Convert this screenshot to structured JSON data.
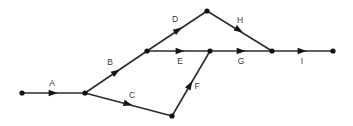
{
  "diagram": {
    "type": "directed-graph",
    "width": 353,
    "height": 126,
    "background_color": "#ffffff",
    "line_color": "#2b2b2b",
    "node_color": "#111111",
    "label_color": "#3a3a3a",
    "nodes": [
      {
        "id": "n1",
        "name": "node-start",
        "x": 22,
        "y": 93
      },
      {
        "id": "n2",
        "name": "node-junction-1",
        "x": 85,
        "y": 93
      },
      {
        "id": "n3",
        "name": "node-junction-2",
        "x": 147,
        "y": 51
      },
      {
        "id": "n4",
        "name": "node-apex",
        "x": 207,
        "y": 11
      },
      {
        "id": "n5",
        "name": "node-middle",
        "x": 210,
        "y": 51
      },
      {
        "id": "n6",
        "name": "node-bottom",
        "x": 172,
        "y": 116
      },
      {
        "id": "n7",
        "name": "node-merge",
        "x": 272,
        "y": 51
      },
      {
        "id": "n8",
        "name": "node-end",
        "x": 333,
        "y": 51
      }
    ],
    "edges": [
      {
        "id": "e-a",
        "label": "A",
        "from": "n1",
        "to": "n2",
        "arrow": {
          "x": 53,
          "y": 93
        },
        "label_pos": {
          "x": 52,
          "y": 84
        }
      },
      {
        "id": "e-b",
        "label": "B",
        "from": "n2",
        "to": "n3",
        "arrow": {
          "x": 116,
          "y": 72
        },
        "label_pos": {
          "x": 110,
          "y": 63
        }
      },
      {
        "id": "e-c",
        "label": "C",
        "from": "n2",
        "to": "n6",
        "arrow": {
          "x": 128,
          "y": 104
        },
        "label_pos": {
          "x": 132,
          "y": 96
        }
      },
      {
        "id": "e-d",
        "label": "D",
        "from": "n3",
        "to": "n4",
        "arrow": {
          "x": 178,
          "y": 30
        },
        "label_pos": {
          "x": 175,
          "y": 20
        }
      },
      {
        "id": "e-e",
        "label": "E",
        "from": "n3",
        "to": "n5",
        "arrow": {
          "x": 180,
          "y": 51
        },
        "label_pos": {
          "x": 180,
          "y": 62
        }
      },
      {
        "id": "e-f",
        "label": "F",
        "from": "n6",
        "to": "n5",
        "arrow": {
          "x": 190,
          "y": 85
        },
        "label_pos": {
          "x": 197,
          "y": 87
        }
      },
      {
        "id": "e-g",
        "label": "G",
        "from": "n5",
        "to": "n7",
        "arrow": {
          "x": 241,
          "y": 51
        },
        "label_pos": {
          "x": 241,
          "y": 62
        }
      },
      {
        "id": "e-h",
        "label": "H",
        "from": "n4",
        "to": "n7",
        "arrow": {
          "x": 239,
          "y": 30
        },
        "label_pos": {
          "x": 240,
          "y": 21
        }
      },
      {
        "id": "e-i",
        "label": "I",
        "from": "n7",
        "to": "n8",
        "arrow": {
          "x": 302,
          "y": 51
        },
        "label_pos": {
          "x": 302,
          "y": 62
        }
      }
    ]
  }
}
